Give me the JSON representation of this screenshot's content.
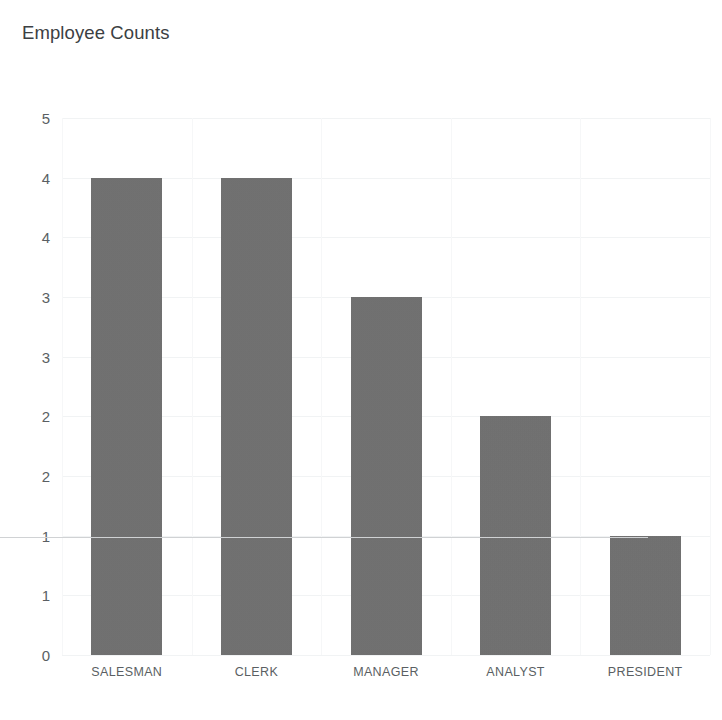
{
  "chart_data": {
    "type": "bar",
    "title": "Employee Counts",
    "xlabel": "",
    "ylabel": "",
    "categories": [
      "SALESMAN",
      "CLERK",
      "MANAGER",
      "ANALYST",
      "PRESIDENT"
    ],
    "values": [
      4,
      4,
      3,
      2,
      1
    ],
    "series": [
      {
        "name": "Employee Counts",
        "values": [
          4,
          4,
          3,
          2,
          1
        ]
      }
    ],
    "ylim": [
      0,
      4.5
    ],
    "ytick_values": [
      4.5,
      4.0,
      3.5,
      3.0,
      2.5,
      2.0,
      1.5,
      1.0,
      0.5,
      0.0
    ],
    "ytick_labels": [
      "5",
      "4",
      "4",
      "3",
      "3",
      "2",
      "2",
      "1",
      "1",
      "0"
    ],
    "xtick_labels": [
      "SALESMAN",
      "CLERK",
      "MANAGER",
      "ANALYST",
      "PRESIDENT"
    ],
    "grid": true,
    "grid_axis": "both",
    "legend": false,
    "legend_position": "none",
    "bar_color": "#6e6e6e",
    "background_color": "#ffffff",
    "title_color": "#3c4043",
    "tick_label_color": "#5a5f63",
    "gridline_color": "#f1f3f4",
    "axis_line_color": "#d0d2d4",
    "annotations": []
  }
}
